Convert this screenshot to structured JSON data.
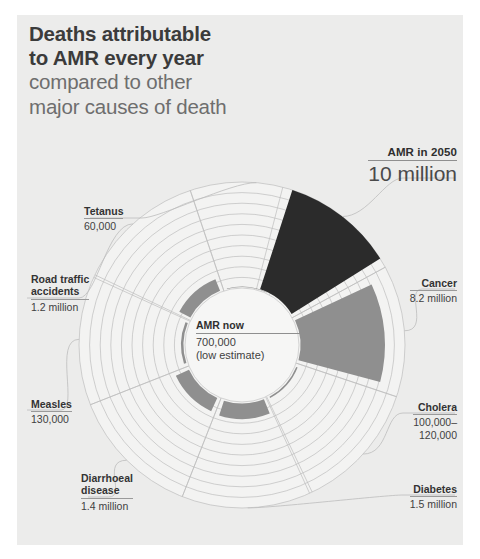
{
  "panel": {
    "bg": "#ececeb"
  },
  "title": {
    "line1": "Deaths attributable",
    "line2": "to AMR every year",
    "line3": "compared to other",
    "line4": "major causes of death"
  },
  "center": {
    "name": "AMR now",
    "value": "700,000",
    "note": "(low estimate)"
  },
  "hero": {
    "name": "AMR in 2050",
    "value": "10 million"
  },
  "labels": {
    "cancer": {
      "name": "Cancer",
      "value": "8.2 million"
    },
    "cholera": {
      "name": "Cholera",
      "value1": "100,000–",
      "value2": "120,000"
    },
    "diabetes": {
      "name": "Diabetes",
      "value": "1.5 million"
    },
    "diarrhoeal": {
      "name1": "Diarrhoeal",
      "name2": "disease",
      "value": "1.4 million"
    },
    "measles": {
      "name": "Measles",
      "value": "130,000"
    },
    "road": {
      "name1": "Road traffic",
      "name2": "accidents",
      "value": "1.2 million"
    },
    "tetanus": {
      "name": "Tetanus",
      "value": "60,000"
    }
  },
  "colors": {
    "dark": "#2b2b2b",
    "mid": "#8f8f8f",
    "panel": "#ececeb",
    "grid": "#bdbdbd",
    "inner": "#f3f3f2",
    "text_dark": "#333333",
    "text_light": "#6e6e6e"
  },
  "chart_data": {
    "type": "pie",
    "title": "Deaths attributable to AMR every year compared to other major causes of death",
    "subtitle": "compared to other major causes of death",
    "units": "deaths per year",
    "center_label": "AMR now 700,000 (low estimate)",
    "radial_scale": {
      "inner_radius_value": 0,
      "max_value": 10000000,
      "rings": 10
    },
    "categories": [
      "AMR in 2050",
      "Cancer",
      "Cholera",
      "Diabetes",
      "Diarrhoeal disease",
      "Measles",
      "Road traffic accidents",
      "Tetanus"
    ],
    "values": [
      10000000,
      8200000,
      110000,
      1500000,
      1400000,
      130000,
      1200000,
      60000
    ],
    "value_labels": [
      "10 million",
      "8.2 million",
      "100,000–120,000",
      "1.5 million",
      "1.4 million",
      "130,000",
      "1.2 million",
      "60,000"
    ],
    "slices": [
      {
        "name": "AMR in 2050",
        "value": 10000000,
        "label": "10 million",
        "color": "#2b2b2b",
        "start_angle": -72,
        "end_angle": -32,
        "radius": 163
      },
      {
        "name": "Cancer",
        "value": 8200000,
        "label": "8.2 million",
        "color": "#8f8f8f",
        "start_angle": -25,
        "end_angle": 15,
        "radius": 143
      },
      {
        "name": "Cholera",
        "value": 110000,
        "label": "100,000–120,000",
        "color": "#8f8f8f",
        "start_angle": 22,
        "end_angle": 62,
        "radius": 60
      },
      {
        "name": "Diabetes",
        "value": 1500000,
        "label": "1.5 million",
        "color": "#8f8f8f",
        "start_angle": 68,
        "end_angle": 108,
        "radius": 74
      },
      {
        "name": "Diarrhoeal disease",
        "value": 1400000,
        "label": "1.4 million",
        "color": "#8f8f8f",
        "start_angle": 115,
        "end_angle": 155,
        "radius": 73
      },
      {
        "name": "Measles",
        "value": 130000,
        "label": "130,000",
        "color": "#8f8f8f",
        "start_angle": 162,
        "end_angle": 202,
        "radius": 61
      },
      {
        "name": "Road traffic accidents",
        "value": 1200000,
        "label": "1.2 million",
        "color": "#8f8f8f",
        "start_angle": 208,
        "end_angle": 248,
        "radius": 71
      },
      {
        "name": "Tetanus",
        "value": 60000,
        "label": "60,000",
        "color": "#8f8f8f",
        "start_angle": 255,
        "end_angle": 295,
        "radius": 58
      }
    ],
    "legend": "none",
    "grid": true
  }
}
